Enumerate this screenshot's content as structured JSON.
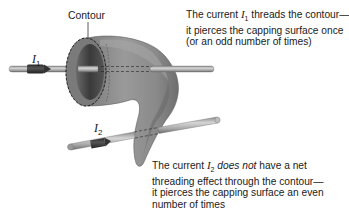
{
  "diagram": {
    "contour_label": "Contour",
    "currents": [
      {
        "symbol": "I",
        "subscript": "1"
      },
      {
        "symbol": "I",
        "subscript": "2"
      }
    ],
    "caption_top": {
      "line1_pre": "The current ",
      "line1_sym": "I",
      "line1_sub": "1",
      "line1_post": " threads the contour—",
      "line2": "it pierces the capping surface once",
      "line3": "(or an odd number of times)"
    },
    "caption_bottom": {
      "line1_pre": "The current ",
      "line1_sym": "I",
      "line1_sub": "2",
      "line1_em": "does not",
      "line1_post": " have a net",
      "line2": "threading effect through the contour—",
      "line3": "it pierces the capping surface an even",
      "line4": "number of times"
    },
    "colors": {
      "surface": "#8a8a8a",
      "surface_light": "#a6a6a6",
      "surface_dark": "#5e5e5e",
      "rod": "#b9b9b9",
      "rod_edge": "#6f6f6f",
      "arrow": "#3c3c3c",
      "text": "#1a1a1a"
    }
  }
}
